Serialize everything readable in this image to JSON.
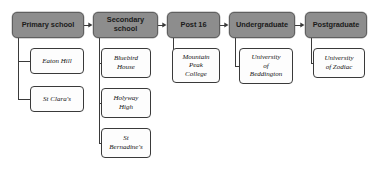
{
  "diagram": {
    "colors": {
      "stage_fill": "#8d8d8d",
      "stage_border": "#5f5f5f",
      "leaf_fill": "#fdfdfd",
      "leaf_border": "#3a3a3a",
      "connector": "#3a3a3a",
      "background": "#ffffff"
    },
    "stages": [
      {
        "id": "primary-school",
        "label": "Primary school",
        "x": 12,
        "y": 12,
        "w": 72,
        "h": 26,
        "leaves": [
          {
            "id": "eaton-hill",
            "label": "Eaton Hill",
            "x": 30,
            "y": 48,
            "w": 54,
            "h": 26
          },
          {
            "id": "st-claras",
            "label": "St Clara's",
            "x": 30,
            "y": 86,
            "w": 54,
            "h": 26
          }
        ]
      },
      {
        "id": "secondary-school",
        "label": "Secondary\nschool",
        "x": 93,
        "y": 12,
        "w": 65,
        "h": 26,
        "leaves": [
          {
            "id": "bluebird-house",
            "label": "Bluebird\nHouse",
            "x": 101,
            "y": 48,
            "w": 50,
            "h": 30
          },
          {
            "id": "holyway-high",
            "label": "Holyway\nHigh",
            "x": 101,
            "y": 88,
            "w": 50,
            "h": 30
          },
          {
            "id": "st-bernadines",
            "label": "St\nBernadine's",
            "x": 101,
            "y": 128,
            "w": 50,
            "h": 30
          }
        ]
      },
      {
        "id": "post-16",
        "label": "Post 16",
        "x": 167,
        "y": 12,
        "w": 53,
        "h": 26,
        "leaves": [
          {
            "id": "mountain-peak-college",
            "label": "Mountain\nPeak\nCollege",
            "x": 172,
            "y": 48,
            "w": 48,
            "h": 35
          }
        ]
      },
      {
        "id": "undergraduate",
        "label": "Undergraduate",
        "x": 229,
        "y": 12,
        "w": 66,
        "h": 26,
        "leaves": [
          {
            "id": "university-of-beddington",
            "label": "University\nof\nBeddington",
            "x": 239,
            "y": 48,
            "w": 54,
            "h": 36
          }
        ]
      },
      {
        "id": "postgraduate",
        "label": "Postgraduate",
        "x": 305,
        "y": 12,
        "w": 62,
        "h": 26,
        "leaves": [
          {
            "id": "university-of-zodiac",
            "label": "University\nof Zodiac",
            "x": 313,
            "y": 48,
            "w": 52,
            "h": 30
          }
        ]
      }
    ]
  }
}
